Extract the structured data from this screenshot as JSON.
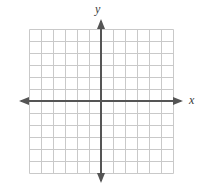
{
  "figure": {
    "type": "coordinate-plane",
    "width": 211,
    "height": 190,
    "background_color": "#ffffff",
    "title": ""
  },
  "grid": {
    "columns": 12,
    "rows": 12,
    "cell_size": 12,
    "left": 29,
    "top": 29,
    "right": 173,
    "bottom": 173,
    "line_color": "#c9c9c9",
    "line_width": 1,
    "visible": true
  },
  "axes": {
    "x_axis": {
      "label": "x",
      "label_x": 189,
      "label_y": 94,
      "position_y": 101,
      "start_x": 19,
      "end_x": 183,
      "color": "#555555",
      "line_width": 2,
      "arrow_start": true,
      "arrow_end": true,
      "tick_labels": [],
      "range": [
        -6,
        6
      ]
    },
    "y_axis": {
      "label": "y",
      "label_x": 95,
      "label_y": 3,
      "position_x": 101,
      "start_y": 19,
      "end_y": 183,
      "color": "#555555",
      "line_width": 2,
      "arrow_start": true,
      "arrow_end": true,
      "tick_labels": [],
      "range": [
        -6,
        6
      ]
    }
  },
  "chart_data": {
    "type": "scatter",
    "title": "",
    "xlabel": "x",
    "ylabel": "y",
    "x": [],
    "y": [],
    "series": [],
    "categories": [],
    "values": [],
    "xlim": [
      -6,
      6
    ],
    "ylim": [
      -6,
      6
    ],
    "xticks": [
      -6,
      -5,
      -4,
      -3,
      -2,
      -1,
      0,
      1,
      2,
      3,
      4,
      5,
      6
    ],
    "yticks": [
      -6,
      -5,
      -4,
      -3,
      -2,
      -1,
      0,
      1,
      2,
      3,
      4,
      5,
      6
    ],
    "xticklabels": [],
    "yticklabels": [],
    "grid": true,
    "legend": [],
    "annotations": []
  }
}
